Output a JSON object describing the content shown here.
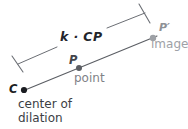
{
  "figure": {
    "background": "#ffffff",
    "width": 188,
    "height": 129
  },
  "labels": {
    "scaled_segment": "k · CP",
    "image_point": "P′",
    "image_caption": "image",
    "preimage_point": "P",
    "preimage_caption": "point",
    "center_point": "C",
    "center_caption_line1": "center of",
    "center_caption_line2": "dilation"
  },
  "colors": {
    "ray": "#5b5e64",
    "bracket": "#6b6e74",
    "dot_dark": "#1b1d22",
    "dot_mid": "#5a5d63",
    "dot_light": "#9ea1a6",
    "text_dark": "#1b1d22",
    "text_mid": "#3b3e44",
    "text_gray": "#7f8287",
    "text_light": "#9ea1a6"
  },
  "geometry": {
    "ray": {
      "x1": 25,
      "y1": 90,
      "x2": 157,
      "y2": 36
    },
    "points": [
      {
        "name": "C",
        "x": 24,
        "y": 90,
        "r": 3.1,
        "shade": "dark"
      },
      {
        "name": "P",
        "x": 79,
        "y": 68,
        "r": 3.0,
        "shade": "mid"
      },
      {
        "name": "P-prime",
        "x": 153,
        "y": 38,
        "r": 3.2,
        "shade": "light"
      }
    ],
    "bracket": {
      "left_tick": {
        "x1": 12,
        "y1": 56,
        "x2": 23,
        "y2": 72
      },
      "right_tick": {
        "x1": 139,
        "y1": 4,
        "x2": 150,
        "y2": 23
      },
      "span_left": {
        "x1": 18,
        "y1": 64,
        "x2": 60,
        "y2": 46
      },
      "span_right": {
        "x1": 108,
        "y1": 27,
        "x2": 145,
        "y2": 13
      }
    }
  }
}
